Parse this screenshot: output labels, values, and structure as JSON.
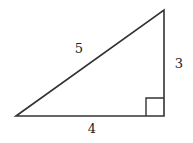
{
  "diagram": {
    "type": "right-triangle",
    "vertices": {
      "left": [
        16,
        116
      ],
      "top_right": [
        164,
        10
      ],
      "bottom_right": [
        164,
        116
      ]
    },
    "right_angle_marker": {
      "corner": "bottom_right",
      "size": 18
    },
    "labels": {
      "hypotenuse": "5",
      "vertical_leg": "3",
      "horizontal_leg": "4"
    },
    "stroke_color": "#333333"
  }
}
